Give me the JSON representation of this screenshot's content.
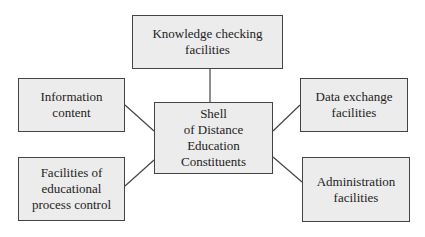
{
  "diagram": {
    "center": {
      "label": "Shell\nof Distance\nEducation\nConstituents"
    },
    "nodes": [
      {
        "id": "knowledge",
        "label": "Knowledge checking\nfacilities"
      },
      {
        "id": "information",
        "label": "Information\ncontent"
      },
      {
        "id": "data-exchange",
        "label": "Data exchange\nfacilities"
      },
      {
        "id": "process-control",
        "label": "Facilities of\neducational\nprocess control"
      },
      {
        "id": "administration",
        "label": "Administration\nfacilities"
      }
    ],
    "colors": {
      "box_fill": "#ececec",
      "border": "#444444",
      "line": "#444444"
    }
  }
}
